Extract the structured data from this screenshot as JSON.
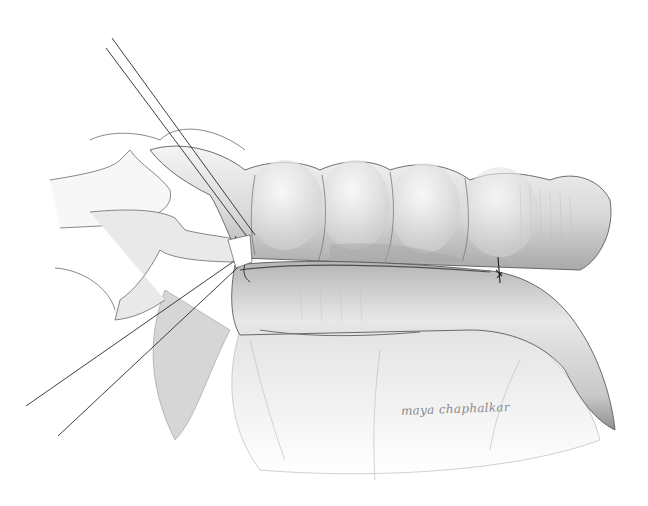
{
  "illustration": {
    "subject": "pencil medical illustration of bowel segments with stay sutures",
    "signature": "maya chaphalkar",
    "palette": {
      "background": "#ffffff",
      "line": "#3a3a3a",
      "shade_dark": "#8c8c8c",
      "shade_mid": "#c4c4c4",
      "shade_light": "#ececec",
      "suture": "#1e1e1e"
    }
  }
}
